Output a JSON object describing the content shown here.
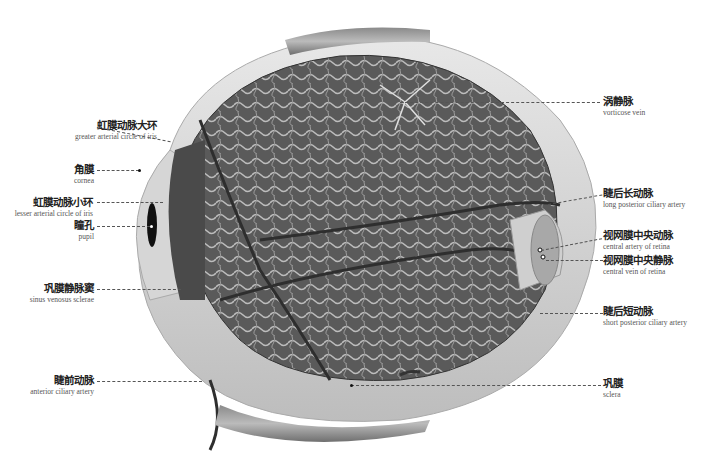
{
  "diagram": {
    "labels_left": [
      {
        "zh": "虹膜动脉大环",
        "en": "greater arterial circle of iris"
      },
      {
        "zh": "角膜",
        "en": "cornea"
      },
      {
        "zh": "虹膜动脉小环",
        "en": "lesser arterial circle of iris"
      },
      {
        "zh": "瞳孔",
        "en": "pupil"
      },
      {
        "zh": "巩膜静脉窦",
        "en": "sinus venosus sclerae"
      },
      {
        "zh": "睫前动脉",
        "en": "anterior ciliary artery"
      }
    ],
    "labels_right": [
      {
        "zh": "涡静脉",
        "en": "vorticose vein"
      },
      {
        "zh": "睫后长动脉",
        "en": "long posterior ciliary artery"
      },
      {
        "zh": "视网膜中央动脉",
        "en": "central artery of retina"
      },
      {
        "zh": "视网膜中央静脉",
        "en": "central vein of retina"
      },
      {
        "zh": "睫后短动脉",
        "en": "short posterior ciliary artery"
      },
      {
        "zh": "巩膜",
        "en": "sclera"
      }
    ]
  }
}
